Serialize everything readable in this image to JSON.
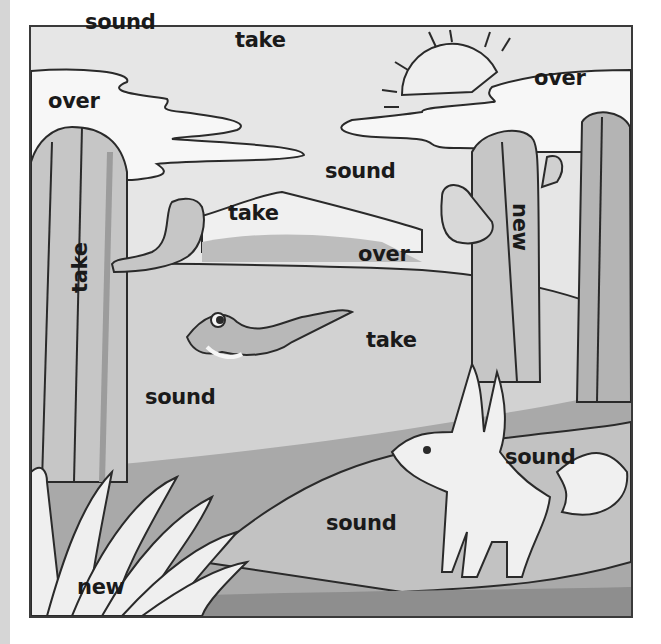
{
  "scene": {
    "description": "Grayscale desert illustration word-find page",
    "characters": [
      "lizard",
      "fennec-fox"
    ],
    "elements": [
      "sun",
      "clouds",
      "mountain",
      "cacti",
      "bush",
      "desert-ground"
    ],
    "colors": {
      "sky": "#e6e6e6",
      "cloud": "#f7f7f7",
      "outline": "#2a2a2a",
      "ground_light": "#cfcfcf",
      "ground_mid": "#bdbdbd",
      "ground_dark": "#9a9a9a",
      "cactus": "#c4c4c4",
      "cactus_shade": "#a2a2a2",
      "text": "#1a1a1a"
    }
  },
  "words": [
    {
      "id": "w1",
      "text": "sound",
      "x": 85,
      "y": 12,
      "rotate": 0
    },
    {
      "id": "w2",
      "text": "take",
      "x": 235,
      "y": 30,
      "rotate": 0
    },
    {
      "id": "w3",
      "text": "over",
      "x": 48,
      "y": 91,
      "rotate": 0
    },
    {
      "id": "w4",
      "text": "over",
      "x": 534,
      "y": 68,
      "rotate": 0
    },
    {
      "id": "w5",
      "text": "sound",
      "x": 325,
      "y": 161,
      "rotate": 0
    },
    {
      "id": "w6",
      "text": "take",
      "x": 228,
      "y": 203,
      "rotate": 0
    },
    {
      "id": "w7",
      "text": "take",
      "x": 70,
      "y": 293,
      "rotate": -90
    },
    {
      "id": "w8",
      "text": "new",
      "x": 523,
      "y": 203,
      "rotate": 90
    },
    {
      "id": "w9",
      "text": "over",
      "x": 358,
      "y": 244,
      "rotate": 0
    },
    {
      "id": "w10",
      "text": "take",
      "x": 366,
      "y": 330,
      "rotate": 0
    },
    {
      "id": "w11",
      "text": "sound",
      "x": 145,
      "y": 387,
      "rotate": 0
    },
    {
      "id": "w12",
      "text": "sound",
      "x": 505,
      "y": 447,
      "rotate": 0
    },
    {
      "id": "w13",
      "text": "sound",
      "x": 326,
      "y": 513,
      "rotate": 0
    },
    {
      "id": "w14",
      "text": "new",
      "x": 77,
      "y": 577,
      "rotate": 0
    }
  ]
}
